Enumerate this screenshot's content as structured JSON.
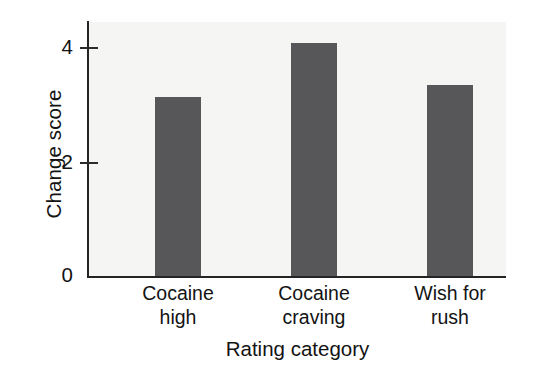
{
  "chart_data": {
    "type": "bar",
    "title": "",
    "subtitle": "",
    "xlabel": "Rating category",
    "ylabel": "Change score",
    "categories": [
      "Cocaine high",
      "Cocaine craving",
      "Wish for rush"
    ],
    "category_lines": [
      [
        "Cocaine",
        "high"
      ],
      [
        "Cocaine",
        "craving"
      ],
      [
        "Wish for",
        "rush"
      ]
    ],
    "values": [
      3.12,
      4.05,
      3.33
    ],
    "ylim": [
      0,
      4.45
    ],
    "yticks": [
      0,
      2,
      4
    ],
    "ytick_labels": [
      "0",
      "2",
      "4"
    ],
    "xlim_note": "categorical, 3 bars",
    "grid": false,
    "legend": null,
    "annotations": [],
    "colors": {
      "bar_fill": "#575759",
      "plot_background": "#f5f5f3",
      "figure_background": "#ffffff",
      "axis_line": "#242424",
      "text": "#131313"
    }
  },
  "axes": {
    "y": {
      "title": "Change score",
      "ticks": [
        {
          "label": "4",
          "value": 4
        },
        {
          "label": "2",
          "value": 2
        },
        {
          "label": "0",
          "value": 0
        }
      ]
    },
    "x": {
      "title": "Rating category",
      "ticks": [
        {
          "line1": "Cocaine",
          "line2": "high"
        },
        {
          "line1": "Cocaine",
          "line2": "craving"
        },
        {
          "line1": "Wish for",
          "line2": "rush"
        }
      ]
    }
  },
  "bars": [
    {
      "name": "cocaine-high",
      "value": 3.12
    },
    {
      "name": "cocaine-craving",
      "value": 4.05
    },
    {
      "name": "wish-for-rush",
      "value": 3.33
    }
  ]
}
